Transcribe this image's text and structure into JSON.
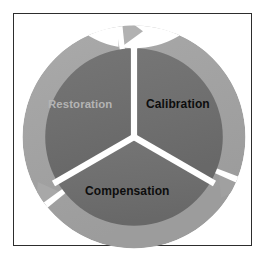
{
  "diagram": {
    "type": "three-segment-cycle",
    "direction": "clockwise",
    "title": "",
    "frame": {
      "border_color": "#2d2d2d",
      "background_color": "#ffffff"
    },
    "colors": {
      "outer_ring": "#a8a8a8",
      "ring_shadow": "#9a9a9a",
      "inner_disk": "#6e6e6e",
      "divider": "#ffffff",
      "label_dark": "#0d0d0d",
      "label_light": "#b4b4b4"
    },
    "center": {
      "x": 134,
      "y": 137
    },
    "radii": {
      "outer": 111,
      "inner": 88
    },
    "segments": [
      {
        "id": "restoration",
        "label": "Restoration",
        "position": "upper-left",
        "start_angle_deg": 180,
        "end_angle_deg": 300,
        "label_color": "#b4b4b4",
        "fill_color": "#6e6e6e",
        "arrow": "arrow-upper-left-to-top"
      },
      {
        "id": "calibration",
        "label": "Calibration",
        "position": "upper-right",
        "start_angle_deg": 300,
        "end_angle_deg": 60,
        "label_color": "#0d0d0d",
        "fill_color": "#6e6e6e",
        "arrow": "arrow-top-to-lower-right"
      },
      {
        "id": "compensation",
        "label": "Compensation",
        "position": "bottom",
        "start_angle_deg": 60,
        "end_angle_deg": 180,
        "label_color": "#0d0d0d",
        "fill_color": "#6e6e6e",
        "arrow": "arrow-lower-right-to-lower-left"
      }
    ],
    "arrows": [
      {
        "id": "arrow-top",
        "points_toward": "clockwise",
        "tip_angle_deg": 275
      },
      {
        "id": "arrow-lower-right",
        "points_toward": "clockwise",
        "tip_angle_deg": 35
      },
      {
        "id": "arrow-lower-left",
        "points_toward": "clockwise",
        "tip_angle_deg": 155
      }
    ]
  }
}
